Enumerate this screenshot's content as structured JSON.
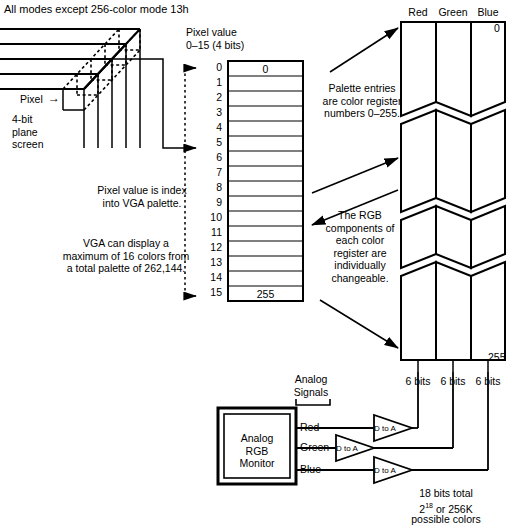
{
  "diagram": {
    "title": "All modes except 256-color mode 13h",
    "annotations": {
      "pixel_value_bits": "Pixel value\n0–15 (4 bits)",
      "pixel_label": "Pixel",
      "pixel_arrow": "→",
      "plane_label": "4-bit\nplane\nscreen",
      "index_note": "Pixel value is index\ninto VGA palette.",
      "capacity_note": "VGA can display a\nmaximum of 16 colors from\na total palette of 262,144.",
      "palette_entries_note": "Palette entries\nare color register\nnumbers 0–255.",
      "rgb_components_note": "The RGB\ncomponents of\neach color\nregister are\nindividually\nchangeable.",
      "analog_signals": "Analog\nSignals",
      "bits_total_note": "18 bits total\n2   or 256K\npossible colors",
      "bits_total_line1": "18 bits total",
      "bits_total_exp_base": "2",
      "bits_total_exp_sup": "18",
      "bits_total_exp_rest": " or 256K",
      "bits_total_line3": "possible colors"
    },
    "palette_table": {
      "row_labels": [
        "0",
        "1",
        "2",
        "3",
        "4",
        "5",
        "6",
        "7",
        "8",
        "9",
        "10",
        "11",
        "12",
        "13",
        "14",
        "15"
      ],
      "first_cell_value": "0",
      "last_cell_value": "255"
    },
    "register_columns": {
      "headers": [
        "Red",
        "Green",
        "Blue"
      ],
      "top_index": "0",
      "bottom_index": "255",
      "bit_labels": [
        "6 bits",
        "6 bits",
        "6 bits"
      ]
    },
    "monitor": {
      "label": "Analog\nRGB\nMonitor",
      "label_line1": "Analog",
      "label_line2": "RGB",
      "label_line3": "Monitor",
      "signal_names": [
        "Red",
        "Green",
        "Blue"
      ],
      "converter_label": "D to A"
    }
  }
}
